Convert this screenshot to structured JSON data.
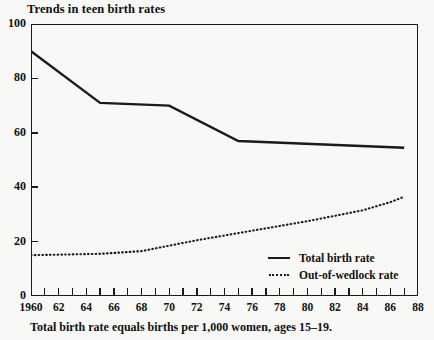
{
  "chart_data": {
    "type": "line",
    "title": "Trends in teen birth rates",
    "caption": "Total birth rate equals births per 1,000 women, ages 15–19.",
    "xlabel": "",
    "ylabel": "",
    "xlim": [
      1960,
      1988
    ],
    "ylim": [
      0,
      100
    ],
    "grid": false,
    "legend_position": "inside-bottom-right",
    "y_ticks": [
      0,
      20,
      40,
      60,
      80,
      100
    ],
    "y_tick_labels": [
      "0",
      "20",
      "40",
      "60",
      "80",
      "100"
    ],
    "x_ticks": [
      1960,
      1962,
      1964,
      1966,
      1968,
      1970,
      1972,
      1974,
      1976,
      1978,
      1980,
      1982,
      1984,
      1986,
      1988
    ],
    "x_tick_labels": [
      "1960",
      "62",
      "64",
      "66",
      "68",
      "70",
      "72",
      "74",
      "76",
      "78",
      "80",
      "82",
      "84",
      "86",
      "88"
    ],
    "x_minor_tick_interval": 1,
    "series": [
      {
        "name": "Total birth rate",
        "style": "solid",
        "color": "#1a1a1a",
        "x": [
          1960,
          1965,
          1970,
          1975,
          1987
        ],
        "values": [
          90,
          71,
          70,
          57,
          54.5
        ]
      },
      {
        "name": "Out-of-wedlock rate",
        "style": "dotted",
        "color": "#1a1a1a",
        "x": [
          1960,
          1965,
          1968,
          1972,
          1976,
          1980,
          1984,
          1986,
          1987
        ],
        "values": [
          15,
          15.5,
          16.5,
          20.5,
          24,
          27.5,
          31.5,
          34.5,
          36.5
        ]
      }
    ]
  },
  "legend": {
    "entries": [
      {
        "label": "Total birth rate",
        "style": "solid"
      },
      {
        "label": "Out-of-wedlock rate",
        "style": "dotted"
      }
    ]
  },
  "colors": {
    "ink": "#1a1a1a",
    "paper": "#f8f8f7"
  }
}
